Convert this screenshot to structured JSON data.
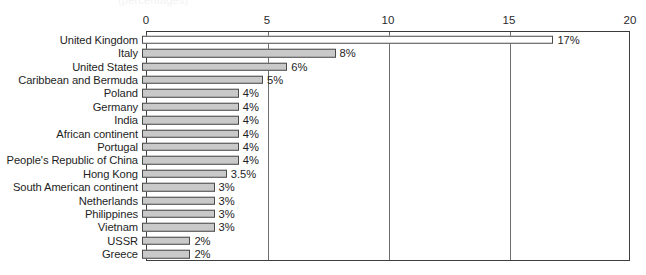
{
  "title_remnant": "(percentages)",
  "chart_data": {
    "type": "bar",
    "orientation": "horizontal",
    "title": "",
    "xlabel": "",
    "ylabel": "",
    "xlim": [
      0,
      20
    ],
    "xticks": [
      "0",
      "5",
      "10",
      "15",
      "20"
    ],
    "gridlines": [
      5,
      10,
      15
    ],
    "grid": true,
    "legend": "none",
    "value_suffix": "%",
    "categories": [
      "United Kingdom",
      "Italy",
      "United States",
      "Caribbean and Bermuda",
      "Poland",
      "Germany",
      "India",
      "African continent",
      "Portugal",
      "People's Republic of China",
      "Hong Kong",
      "South American continent",
      "Netherlands",
      "Philippines",
      "Vietnam",
      "USSR",
      "Greece"
    ],
    "values": [
      17,
      8,
      6,
      5,
      4,
      4,
      4,
      4,
      4,
      4,
      3.5,
      3,
      3,
      3,
      3,
      2,
      2
    ],
    "labels": [
      "17%",
      "8%",
      "6%",
      "5%",
      "4%",
      "4%",
      "4%",
      "4%",
      "4%",
      "4%",
      "3.5%",
      "3%",
      "3%",
      "3%",
      "3%",
      "2%",
      "2%"
    ],
    "bar_styles": [
      "light",
      "filled",
      "filled",
      "filled",
      "filled",
      "filled",
      "filled",
      "filled",
      "filled",
      "filled",
      "filled",
      "filled",
      "filled",
      "filled",
      "filled",
      "filled",
      "filled"
    ],
    "colors": {
      "bar_fill": "#c9c9c9",
      "bar_fill_light": "#ffffff",
      "bar_stroke": "#4a4a4a",
      "axis": "#3a3a3a",
      "gridline": "#6e6e6e",
      "text": "#1e1e1e",
      "background": "#ffffff"
    }
  }
}
